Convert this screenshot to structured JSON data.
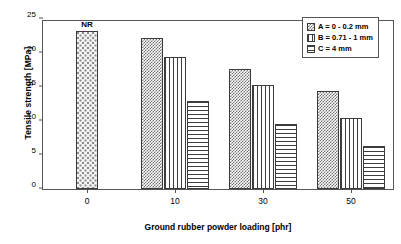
{
  "chart_data": {
    "type": "bar",
    "title": "",
    "xlabel": "Ground rubber powder loading [phr]",
    "ylabel": "Tensile strength [MPa]",
    "categories": [
      "0",
      "10",
      "30",
      "50"
    ],
    "ylim": [
      0,
      25
    ],
    "yticks": [
      0,
      5,
      10,
      15,
      20,
      25
    ],
    "ytick_labels": [
      "0",
      "5",
      "10",
      "15",
      "20",
      "25"
    ],
    "grid": false,
    "legend_position": "top-right",
    "series": [
      {
        "name": "A = 0 - 0.2 mm",
        "pattern": "cross-hatch",
        "values": [
          null,
          22.2,
          17.7,
          14.4
        ]
      },
      {
        "name": "B = 0.71 - 1 mm",
        "pattern": "vertical-lines",
        "values": [
          null,
          19.4,
          15.3,
          10.5
        ]
      },
      {
        "name": "C = 4 mm",
        "pattern": "horizontal-lines",
        "values": [
          null,
          12.9,
          9.6,
          6.3
        ]
      }
    ],
    "reference_bar": {
      "label": "NR",
      "category": "0",
      "value": 23.2,
      "pattern": "dots"
    },
    "annotations": [
      {
        "text": "NR",
        "category": "0",
        "value": 23.2
      }
    ]
  },
  "legend": {
    "items": [
      {
        "label": "A = 0 - 0.2 mm"
      },
      {
        "label": "B = 0.71 - 1 mm"
      },
      {
        "label": "C = 4 mm"
      }
    ]
  },
  "axes": {
    "y_title": "Tensile strength [MPa]",
    "x_title": "Ground rubber powder loading [phr]",
    "y_labels": [
      "0",
      "5",
      "10",
      "15",
      "20",
      "25"
    ],
    "x_labels": [
      "0",
      "10",
      "30",
      "50"
    ]
  }
}
